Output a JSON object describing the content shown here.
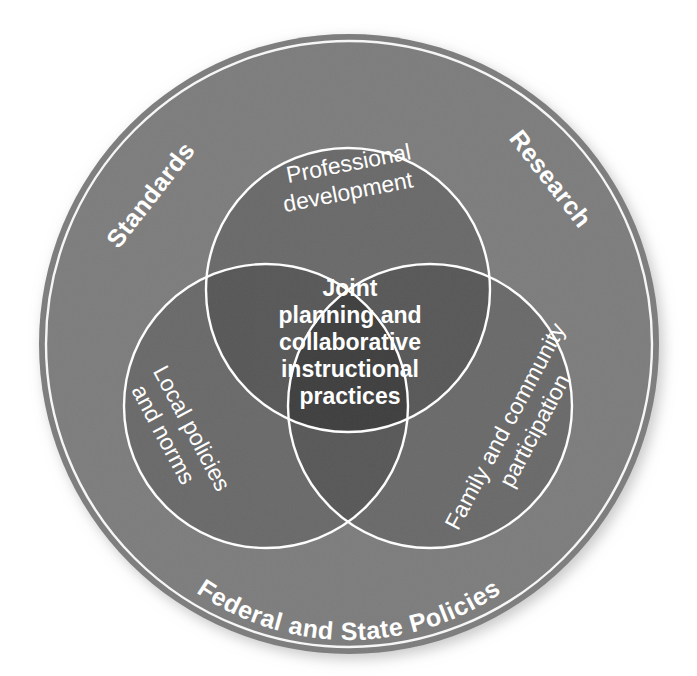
{
  "diagram": {
    "type": "venn-three-circle-in-ring",
    "title_center": {
      "lines": [
        "Joint",
        "planning and",
        "collaborative",
        "instructional",
        "practices"
      ],
      "full_text": "Joint planning and collaborative instructional practices"
    },
    "ring_labels": [
      {
        "id": "standards",
        "text": "Standards"
      },
      {
        "id": "research",
        "text": "Research"
      },
      {
        "id": "federal-state-policies",
        "text": "Federal and State Policies"
      }
    ],
    "circle_labels": [
      {
        "id": "professional-development",
        "lines": [
          "Professional",
          "development"
        ],
        "full_text": "Professional development"
      },
      {
        "id": "local-policies-and-norms",
        "lines": [
          "Local policies",
          "and norms"
        ],
        "full_text": "Local policies and norms"
      },
      {
        "id": "family-and-community-participation",
        "lines": [
          "Family and community",
          "participation"
        ],
        "full_text": "Family and community participation"
      }
    ],
    "colors": {
      "background": "#ffffff",
      "outer_ring": "#7d7d7d",
      "circle_single": "#6a6a6a",
      "circle_double": "#585858",
      "circle_triple": "#3f3f3f",
      "stroke": "#ffffff",
      "text": "#ffffff"
    }
  }
}
